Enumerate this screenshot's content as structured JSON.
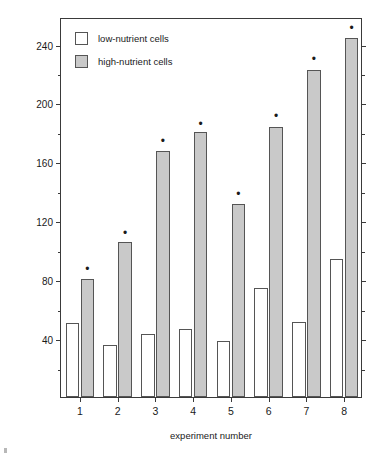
{
  "chart_data": {
    "type": "bar",
    "title": "",
    "xlabel": "experiment number",
    "ylabel": "mean ng protein eaten per copepod per hour",
    "categories": [
      "1",
      "2",
      "3",
      "4",
      "5",
      "6",
      "7",
      "8"
    ],
    "series": [
      {
        "name": "low-nutrient cells",
        "color": "#ffffff",
        "values": [
          50,
          35,
          43,
          46,
          38,
          74,
          51,
          94
        ]
      },
      {
        "name": "high-nutrient cells",
        "color": "#c9c9c9",
        "values": [
          80,
          105,
          167,
          180,
          131,
          183,
          222,
          244
        ]
      }
    ],
    "ylim": [
      0,
      258
    ],
    "ytick_major": [
      40,
      80,
      120,
      160,
      200,
      240
    ],
    "ytick_major_labels": [
      "40",
      "80",
      "120",
      "160",
      "200",
      "240"
    ],
    "ytick_minor": [
      20,
      60,
      100,
      140,
      180,
      220
    ],
    "grid": false,
    "legend_position": "top-left",
    "annotations": {
      "significance_marker": "•",
      "marked_series": "high-nutrient cells",
      "marked_categories": [
        "1",
        "2",
        "3",
        "4",
        "5",
        "6",
        "7",
        "8"
      ],
      "marker_values": [
        88,
        113,
        175,
        187,
        139,
        192,
        231,
        252
      ]
    }
  },
  "legend": {
    "items": [
      {
        "label": "low-nutrient cells",
        "swatch": "low"
      },
      {
        "label": "high-nutrient cells",
        "swatch": "high"
      }
    ]
  },
  "axes": {
    "x_title": "experiment number",
    "y_title": "mean ng protein eaten per copepod per hour"
  }
}
